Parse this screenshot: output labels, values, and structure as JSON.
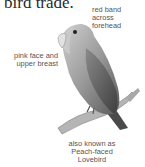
{
  "heading": "bird trade.",
  "labels": {
    "forehead": [
      "red band",
      "across",
      "forehead"
    ],
    "face": [
      "pink face and",
      "upper breast"
    ],
    "aka": [
      "also known as",
      "Peach-faced",
      "Lovebird"
    ]
  },
  "illustration": {
    "subject": "lovebird-illustration",
    "style": "grayscale"
  }
}
